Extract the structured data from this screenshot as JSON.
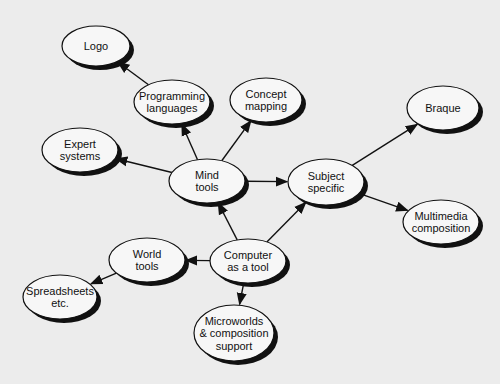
{
  "diagram": {
    "type": "concept map",
    "background": "#ececec",
    "colors": {
      "node_fill": "#f7f7f7",
      "node_stroke": "#111111",
      "shadow": "#111111",
      "edge": "#111111"
    },
    "nodes": [
      {
        "id": "logo",
        "lines": [
          "Logo"
        ],
        "cx": 96,
        "cy": 46,
        "rx": 34,
        "ry": 20
      },
      {
        "id": "programming",
        "lines": [
          "Programming",
          "languages"
        ],
        "cx": 172,
        "cy": 102,
        "rx": 38,
        "ry": 22
      },
      {
        "id": "concept",
        "lines": [
          "Concept",
          "mapping"
        ],
        "cx": 266,
        "cy": 100,
        "rx": 36,
        "ry": 22
      },
      {
        "id": "braque",
        "lines": [
          "Braque"
        ],
        "cx": 443,
        "cy": 108,
        "rx": 36,
        "ry": 22
      },
      {
        "id": "expert",
        "lines": [
          "Expert",
          "systems"
        ],
        "cx": 80,
        "cy": 150,
        "rx": 38,
        "ry": 22
      },
      {
        "id": "mind",
        "lines": [
          "Mind",
          "tools"
        ],
        "cx": 207,
        "cy": 181,
        "rx": 38,
        "ry": 22
      },
      {
        "id": "subject",
        "lines": [
          "Subject",
          "specific"
        ],
        "cx": 326,
        "cy": 182,
        "rx": 38,
        "ry": 23
      },
      {
        "id": "multimedia",
        "lines": [
          "Multimedia",
          "composition"
        ],
        "cx": 441,
        "cy": 222,
        "rx": 38,
        "ry": 22
      },
      {
        "id": "world",
        "lines": [
          "World",
          "tools"
        ],
        "cx": 147,
        "cy": 260,
        "rx": 38,
        "ry": 22
      },
      {
        "id": "computer",
        "lines": [
          "Computer",
          "as a tool"
        ],
        "cx": 248,
        "cy": 261,
        "rx": 38,
        "ry": 22
      },
      {
        "id": "spreadsheets",
        "lines": [
          "Spreadsheets",
          "etc."
        ],
        "cx": 60,
        "cy": 297,
        "rx": 37,
        "ry": 22
      },
      {
        "id": "microworlds",
        "lines": [
          "Microworlds",
          "& composition",
          "support"
        ],
        "cx": 234,
        "cy": 333,
        "rx": 40,
        "ry": 28
      }
    ],
    "edges": [
      {
        "from": "programming",
        "to": "logo"
      },
      {
        "from": "mind",
        "to": "programming"
      },
      {
        "from": "mind",
        "to": "concept"
      },
      {
        "from": "mind",
        "to": "expert"
      },
      {
        "from": "mind",
        "to": "subject"
      },
      {
        "from": "subject",
        "to": "braque"
      },
      {
        "from": "subject",
        "to": "multimedia"
      },
      {
        "from": "computer",
        "to": "mind"
      },
      {
        "from": "computer",
        "to": "subject"
      },
      {
        "from": "computer",
        "to": "world"
      },
      {
        "from": "computer",
        "to": "microworlds"
      },
      {
        "from": "world",
        "to": "spreadsheets"
      }
    ]
  }
}
